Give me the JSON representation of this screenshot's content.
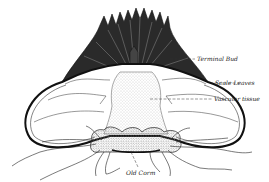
{
  "diagram": {
    "labels": {
      "terminal_bud": "Terminal Bud",
      "scale_leaves": "Scale Leaves",
      "vascular_tissue": "Vascular tissue",
      "old_corm": "Old Corm"
    },
    "colors": {
      "ink": "#1a1a1a",
      "background": "#ffffff",
      "stipple": "#b8b8b8"
    }
  }
}
